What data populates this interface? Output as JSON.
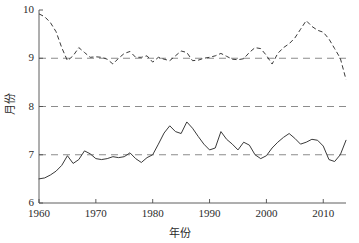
{
  "chart_data": {
    "type": "line",
    "title": "",
    "xlabel": "年份",
    "ylabel": "月份",
    "xlim": [
      1960,
      2014
    ],
    "ylim": [
      6,
      10
    ],
    "xticks": [
      1960,
      1970,
      1980,
      1990,
      2000,
      2010
    ],
    "yticks": [
      6,
      7,
      8,
      9,
      10
    ],
    "grid": true,
    "gridlines_y": [
      7,
      8,
      9
    ],
    "legend_position": "none",
    "x": [
      1960,
      1961,
      1962,
      1963,
      1964,
      1965,
      1966,
      1967,
      1968,
      1969,
      1970,
      1971,
      1972,
      1973,
      1974,
      1975,
      1976,
      1977,
      1978,
      1979,
      1980,
      1981,
      1982,
      1983,
      1984,
      1985,
      1986,
      1987,
      1988,
      1989,
      1990,
      1991,
      1992,
      1993,
      1994,
      1995,
      1996,
      1997,
      1998,
      1999,
      2000,
      2001,
      2002,
      2003,
      2004,
      2005,
      2006,
      2007,
      2008,
      2009,
      2010,
      2011,
      2012,
      2013,
      2014
    ],
    "series": [
      {
        "name": "结束月份",
        "style": "dashed",
        "color": "#3a3a3a",
        "values": [
          9.92,
          9.86,
          9.74,
          9.55,
          9.22,
          8.95,
          9.05,
          9.22,
          9.12,
          9.02,
          9.03,
          9.02,
          8.98,
          8.88,
          9.0,
          9.1,
          9.14,
          9.02,
          9.02,
          9.05,
          8.92,
          9.02,
          8.98,
          8.95,
          9.05,
          9.15,
          9.12,
          8.95,
          8.96,
          9.0,
          9.02,
          9.05,
          9.1,
          9.04,
          8.98,
          8.97,
          8.99,
          9.12,
          9.22,
          9.2,
          9.06,
          8.88,
          9.1,
          9.22,
          9.3,
          9.42,
          9.6,
          9.78,
          9.66,
          9.58,
          9.54,
          9.4,
          9.2,
          9.0,
          8.56
        ]
      },
      {
        "name": "开始月份",
        "style": "solid",
        "color": "#3a3a3a",
        "values": [
          6.5,
          6.52,
          6.58,
          6.66,
          6.78,
          6.98,
          6.82,
          6.9,
          7.08,
          7.02,
          6.92,
          6.9,
          6.92,
          6.96,
          6.94,
          6.96,
          7.04,
          6.92,
          6.84,
          6.94,
          7.0,
          7.22,
          7.45,
          7.6,
          7.48,
          7.44,
          7.68,
          7.55,
          7.38,
          7.22,
          7.1,
          7.14,
          7.48,
          7.32,
          7.22,
          7.1,
          7.26,
          7.2,
          7.0,
          6.92,
          6.98,
          7.14,
          7.26,
          7.36,
          7.44,
          7.34,
          7.22,
          7.26,
          7.32,
          7.3,
          7.18,
          6.9,
          6.86,
          7.0,
          7.3
        ]
      }
    ]
  },
  "axis": {
    "ylabel_text": "月份",
    "xlabel_text": "年份",
    "ytick_labels": [
      "10",
      "9",
      "8",
      "7",
      "6"
    ],
    "xtick_labels": [
      "1960",
      "1970",
      "1980",
      "1990",
      "2000",
      "2010"
    ]
  }
}
